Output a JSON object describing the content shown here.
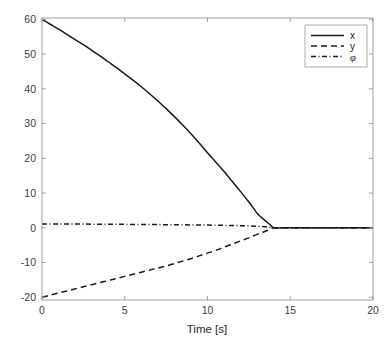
{
  "chart_data": {
    "type": "line",
    "title": "",
    "subtitle": "",
    "xlabel": "Time [s]",
    "ylabel": "",
    "xlim": [
      0,
      20
    ],
    "ylim": [
      -20.8,
      60.4
    ],
    "xticks": [
      0,
      5,
      10,
      15,
      20
    ],
    "xticklabels": [
      "0",
      "5",
      "10",
      "15",
      "20"
    ],
    "yticks": [
      -20,
      -10,
      0,
      10,
      20,
      30,
      40,
      50,
      60
    ],
    "yticklabels": [
      "-20",
      "-10",
      "0",
      "10",
      "20",
      "30",
      "40",
      "50",
      "60"
    ],
    "grid": false,
    "legend_position": "top-right",
    "background": "#ffffff",
    "axis_color": "#9a9a9a",
    "line_color": "#1a1a1a",
    "convergence_time": 14.0,
    "series": [
      {
        "name": "x",
        "label": "x",
        "style": "solid",
        "dasharray": "none",
        "x": [
          0,
          0.5,
          1,
          1.5,
          2,
          2.5,
          3,
          3.5,
          4,
          4.5,
          5,
          5.5,
          6,
          6.5,
          7,
          7.5,
          8,
          8.5,
          9,
          9.5,
          10,
          10.5,
          11,
          11.5,
          12,
          12.5,
          13,
          13.25,
          13.5,
          13.75,
          14,
          14.5,
          15,
          16,
          17,
          18,
          19,
          20
        ],
        "values": [
          60,
          58.6,
          57.2,
          55.7,
          54.2,
          52.7,
          51.1,
          49.5,
          47.8,
          46.1,
          44.3,
          42.5,
          40.6,
          38.6,
          36.5,
          34.3,
          32.0,
          29.6,
          27.1,
          24.4,
          21.6,
          18.9,
          16.2,
          13.3,
          10.4,
          7.4,
          4.2,
          3.0,
          2.0,
          1.0,
          0,
          0,
          0,
          0,
          0,
          0,
          0,
          0
        ]
      },
      {
        "name": "y",
        "label": "y",
        "style": "dashed",
        "dasharray": "6,4",
        "x": [
          0,
          0.5,
          1,
          1.5,
          2,
          2.5,
          3,
          3.5,
          4,
          4.5,
          5,
          5.5,
          6,
          6.5,
          7,
          7.5,
          8,
          8.5,
          9,
          9.5,
          10,
          10.5,
          11,
          11.5,
          12,
          12.5,
          13,
          13.25,
          13.5,
          13.75,
          14,
          14.5,
          15,
          16,
          17,
          18,
          19,
          20
        ],
        "values": [
          -20,
          -19.4,
          -18.8,
          -18.2,
          -17.6,
          -17.0,
          -16.4,
          -15.8,
          -15.2,
          -14.6,
          -14.0,
          -13.4,
          -12.8,
          -12.2,
          -11.6,
          -11.0,
          -10.3,
          -9.6,
          -8.9,
          -8.1,
          -7.3,
          -6.5,
          -5.6,
          -4.7,
          -3.8,
          -2.9,
          -1.9,
          -1.45,
          -1.0,
          -0.5,
          0,
          0,
          0,
          0,
          0,
          0,
          0,
          0
        ]
      },
      {
        "name": "phi",
        "label": "φ",
        "style": "dash-dot",
        "dasharray": "5,2.5,1,2.5",
        "x": [
          0,
          1,
          2,
          3,
          4,
          5,
          6,
          7,
          8,
          9,
          10,
          11,
          12,
          13,
          13.5,
          14,
          15,
          16,
          17,
          18,
          19,
          20
        ],
        "values": [
          1.1,
          1.08,
          1.06,
          1.04,
          1.01,
          0.98,
          0.95,
          0.91,
          0.87,
          0.82,
          0.76,
          0.69,
          0.6,
          0.45,
          0.3,
          0,
          0,
          0,
          0,
          0,
          0,
          0
        ]
      }
    ]
  },
  "legend": {
    "entries": [
      {
        "label": "x"
      },
      {
        "label": "y"
      },
      {
        "label": "φ"
      }
    ]
  }
}
